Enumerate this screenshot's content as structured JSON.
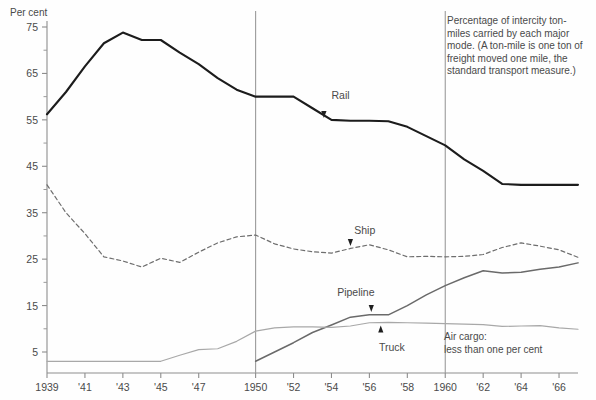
{
  "chart_data": {
    "type": "line",
    "title": "",
    "xlabel": "",
    "ylabel": "Per cent",
    "ylim": [
      0,
      78
    ],
    "xlim": [
      1939,
      1967
    ],
    "grid": false,
    "legend_position": "inline-labels",
    "y_ticks_major": [
      5,
      15,
      25,
      35,
      45,
      55,
      65,
      75
    ],
    "y_ticks_minor": [
      10,
      20,
      30,
      40,
      50,
      60,
      70
    ],
    "x_tick_labels": [
      "1939",
      "'41",
      "'43",
      "'45",
      "'47",
      "1950",
      "'52",
      "'54",
      "'56",
      "'58",
      "1960",
      "'62",
      "'64",
      "'66"
    ],
    "x_tick_years": [
      1939,
      1941,
      1943,
      1945,
      1947,
      1950,
      1952,
      1954,
      1956,
      1958,
      1960,
      1962,
      1964,
      1966
    ],
    "reference_lines": [
      {
        "year": 1950,
        "label": "1950"
      },
      {
        "year": 1960,
        "label": "1960"
      }
    ],
    "x": [
      1939,
      1940,
      1941,
      1942,
      1943,
      1944,
      1945,
      1946,
      1947,
      1948,
      1949,
      1950,
      1951,
      1952,
      1953,
      1954,
      1955,
      1956,
      1957,
      1958,
      1959,
      1960,
      1961,
      1962,
      1963,
      1964,
      1965,
      1966,
      1967
    ],
    "series": [
      {
        "name": "Rail",
        "style": "solid-heavy",
        "color": "#1c1c1c",
        "values": [
          56.2,
          61.0,
          66.5,
          71.5,
          73.8,
          72.2,
          72.2,
          69.5,
          67.0,
          64.0,
          61.5,
          60.0,
          60.0,
          60.0,
          57.5,
          55.0,
          54.8,
          54.8,
          54.7,
          53.5,
          51.5,
          49.5,
          46.5,
          44.0,
          41.2,
          41.0,
          41.0,
          41.0,
          41.0
        ]
      },
      {
        "name": "Ship",
        "style": "dashed",
        "color": "#6e6e6e",
        "values": [
          41.0,
          35.0,
          30.5,
          25.5,
          24.6,
          23.3,
          25.2,
          24.3,
          26.5,
          28.5,
          29.8,
          30.2,
          28.3,
          27.2,
          26.6,
          26.3,
          27.3,
          28.1,
          27.0,
          25.5,
          25.6,
          25.5,
          25.6,
          26.0,
          27.5,
          28.5,
          27.8,
          27.0,
          25.4
        ]
      },
      {
        "name": "Pipeline",
        "style": "solid-medium",
        "color": "#6a6a6a",
        "values": [
          null,
          null,
          null,
          null,
          null,
          null,
          null,
          null,
          null,
          null,
          null,
          3.0,
          5.0,
          7.0,
          9.2,
          10.8,
          12.5,
          13.0,
          13.0,
          15.0,
          17.3,
          19.3,
          21.0,
          22.5,
          22.0,
          22.2,
          22.8,
          23.3,
          24.2
        ]
      },
      {
        "name": "Truck",
        "style": "solid-light",
        "color": "#a8a8a8",
        "values": [
          3.0,
          3.0,
          3.0,
          3.0,
          3.0,
          3.0,
          3.0,
          4.3,
          5.5,
          5.7,
          7.3,
          9.5,
          10.2,
          10.4,
          10.4,
          10.3,
          10.6,
          11.3,
          11.4,
          11.3,
          11.2,
          11.1,
          11.0,
          10.9,
          10.5,
          10.6,
          10.7,
          10.2,
          9.9
        ]
      }
    ],
    "inline_labels": [
      {
        "text": "Rail",
        "year": 1954.0,
        "value": 59.5,
        "arrow_to_year": 1953.6,
        "arrow_to_value": 55.2
      },
      {
        "text": "Ship",
        "year": 1955.2,
        "value": 30.5,
        "arrow_to_year": 1955.0,
        "arrow_to_value": 27.6
      },
      {
        "text": "Pipeline",
        "year": 1954.3,
        "value": 17.0,
        "arrow_to_year": 1956.1,
        "arrow_to_value": 13.4
      },
      {
        "text": "Truck",
        "year": 1956.5,
        "value": 5.2,
        "arrow_to_year": 1956.6,
        "arrow_to_value": 10.9
      }
    ],
    "annotations": [
      {
        "name": "caption",
        "text": "Percentage of intercity ton-miles carried by each major mode. (A ton-mile is one ton of freight moved one mile, the standard transport measure.)",
        "lines": [
          "Percentage of intercity ton-",
          "miles carried by each major",
          "mode. (A ton-mile is one ton of",
          "freight moved one mile, the",
          "standard transport measure.)"
        ]
      },
      {
        "name": "air-cargo-note",
        "text": "Air cargo: less than one per cent",
        "lines": [
          "Air cargo:",
          "less than one per cent"
        ]
      }
    ]
  }
}
